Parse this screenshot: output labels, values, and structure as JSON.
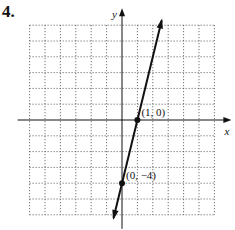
{
  "problem_number": "4.",
  "chart_data": {
    "type": "line",
    "title": "",
    "xlabel": "x",
    "ylabel": "y",
    "xlim": [
      -6,
      6
    ],
    "ylim": [
      -6,
      6
    ],
    "grid": true,
    "grid_style": "dotted",
    "series": [
      {
        "name": "line",
        "equation": "y = 4x - 4",
        "x": [
          -0.5,
          1,
          0,
          1.6
        ],
        "y": [
          -6,
          0,
          -4,
          2.4
        ],
        "arrows": "both",
        "color": "#111111"
      }
    ],
    "points": [
      {
        "x": 1,
        "y": 0,
        "label": "(1, 0)"
      },
      {
        "x": 0,
        "y": -4,
        "label": "(0, −4)"
      }
    ]
  }
}
